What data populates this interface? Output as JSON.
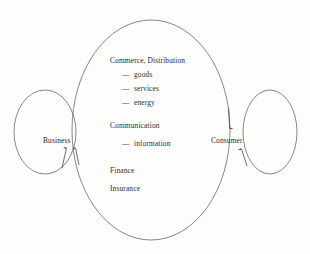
{
  "diagram": {
    "background_color": "#fdfdfc",
    "stroke_color": "#4a4a4a",
    "text_color": "#2b2b2b",
    "nodes": [
      {
        "id": "business",
        "label": "Business",
        "x": 70,
        "y": 140
      },
      {
        "id": "consumer",
        "label": "Consumer",
        "x": 232,
        "y": 140
      }
    ],
    "flows": {
      "commerce": {
        "heading": "Commerce, Distribution",
        "marker": "—",
        "items": [
          "goods",
          "services",
          "energy"
        ]
      },
      "communication": {
        "heading": "Communication",
        "marker": "—",
        "items": [
          "information"
        ]
      },
      "other": [
        "Finance",
        "Insurance"
      ]
    },
    "edges": [
      {
        "id": "business-self-loop",
        "from": "business",
        "to": "business",
        "shape": "ellipse",
        "side": "left",
        "arrow": "up-into-business"
      },
      {
        "id": "consumer-self-loop",
        "from": "consumer",
        "to": "consumer",
        "shape": "ellipse",
        "side": "right",
        "arrow": "up-into-consumer"
      },
      {
        "id": "business-to-consumer",
        "from": "business",
        "to": "consumer",
        "shape": "ellipse-top",
        "arrow": "down-into-consumer"
      },
      {
        "id": "consumer-to-business",
        "from": "consumer",
        "to": "business",
        "shape": "ellipse-bottom",
        "arrow": "up-into-business"
      }
    ]
  }
}
